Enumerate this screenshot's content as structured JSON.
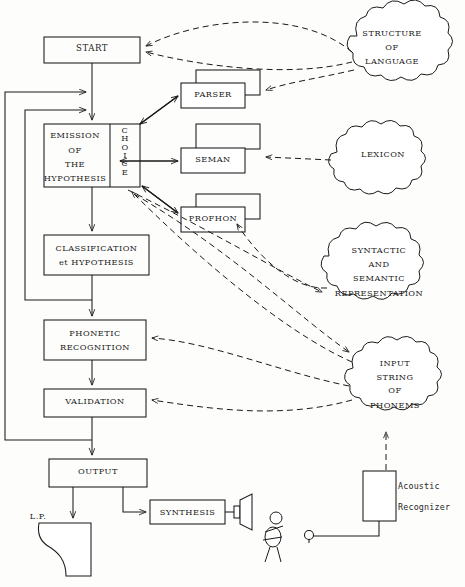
{
  "diagram": {
    "stroke_color": "#1a1a1a",
    "background_color": "#fdfdfc"
  },
  "process_boxes": [
    {
      "id": "start",
      "label": "START"
    },
    {
      "id": "emission",
      "label_lines": [
        "EMISSION",
        "OF",
        "THE",
        "HYPOTHESIS"
      ]
    },
    {
      "id": "choice",
      "label": "CHOICE",
      "orientation": "vertical"
    },
    {
      "id": "classification",
      "label_lines": [
        "CLASSIFICATION",
        "et HYPOTHESIS"
      ]
    },
    {
      "id": "phonetic",
      "label_lines": [
        "PHONETIC",
        "RECOGNITION"
      ]
    },
    {
      "id": "validation",
      "label": "VALIDATION"
    },
    {
      "id": "output",
      "label": "OUTPUT"
    },
    {
      "id": "synthesis",
      "label": "SYNTHESIS"
    }
  ],
  "module_boxes": [
    {
      "id": "parser",
      "label": "PARSER"
    },
    {
      "id": "seman",
      "label": "SEMAN"
    },
    {
      "id": "profhon",
      "label": "PROFHON"
    }
  ],
  "knowledge_clouds": [
    {
      "id": "structure-of-language",
      "label_lines": [
        "STRUCTURE",
        "OF",
        "LANGUAGE"
      ]
    },
    {
      "id": "lexicon",
      "label_lines": [
        "LEXICON"
      ]
    },
    {
      "id": "syntactic-semantic",
      "label_lines": [
        "SYNTACTIC",
        "AND",
        "SEMANTIC",
        "REPRESENTATION"
      ]
    },
    {
      "id": "input-string",
      "label_lines": [
        "INPUT",
        "STRING",
        "OF",
        "PHONEMS"
      ]
    }
  ],
  "devices": [
    {
      "id": "acoustic-recognizer",
      "label_lines": [
        "Acoustic",
        "Recognizer"
      ]
    },
    {
      "id": "loudspeaker",
      "label": ""
    },
    {
      "id": "microphone",
      "label": ""
    },
    {
      "id": "listener-figure",
      "label": ""
    }
  ],
  "annotations": [
    {
      "id": "line-printer",
      "label": "L.P."
    }
  ]
}
